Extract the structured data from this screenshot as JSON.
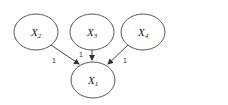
{
  "diagram": {
    "type": "directed-graph",
    "nodes": [
      {
        "id": "x2",
        "label": "X",
        "sub": "2",
        "cx": 36,
        "cy": 32
      },
      {
        "id": "x3",
        "label": "X",
        "sub": "3",
        "cx": 92,
        "cy": 32
      },
      {
        "id": "x4",
        "label": "X",
        "sub": "4",
        "cx": 143,
        "cy": 32
      },
      {
        "id": "x1",
        "label": "X",
        "sub": "1",
        "cx": 93,
        "cy": 79
      }
    ],
    "edges": [
      {
        "from": "x2",
        "to": "x1",
        "label": "1"
      },
      {
        "from": "x3",
        "to": "x1",
        "label": "1"
      },
      {
        "from": "x4",
        "to": "x1",
        "label": "1"
      }
    ],
    "colors": {
      "stroke": "#555555",
      "background": "#ffffff"
    }
  }
}
